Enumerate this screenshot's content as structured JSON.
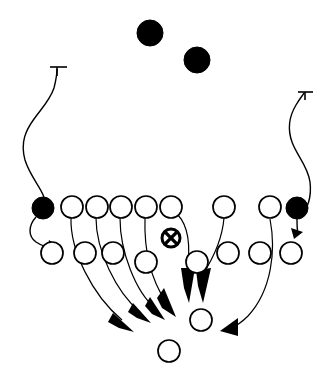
{
  "diagram": {
    "type": "american-football-play",
    "background_color": "#ffffff",
    "line_color": "#000000",
    "width": 332,
    "height": 384,
    "legend": {
      "filled_circle": "defensive-back",
      "open_circle": "offensive-player",
      "circle_with_x": "ball-carrier",
      "arrow": "movement-route",
      "t-bar": "block-or-stop-route"
    },
    "defenders_deep": [
      {
        "name": "deep-defender-left",
        "cx": 150,
        "cy": 33,
        "r": 13
      },
      {
        "name": "deep-defender-right",
        "cx": 197,
        "cy": 60,
        "r": 13
      }
    ],
    "defenders_edge": [
      {
        "name": "edge-defender-left",
        "cx": 43,
        "cy": 208,
        "r": 11
      },
      {
        "name": "edge-defender-right",
        "cx": 297,
        "cy": 208,
        "r": 11
      }
    ],
    "front_row": [
      {
        "name": "front-1",
        "cx": 72,
        "cy": 207,
        "r": 11
      },
      {
        "name": "front-2",
        "cx": 97,
        "cy": 207,
        "r": 11
      },
      {
        "name": "front-3",
        "cx": 121,
        "cy": 207,
        "r": 11
      },
      {
        "name": "front-4",
        "cx": 146,
        "cy": 207,
        "r": 11
      },
      {
        "name": "front-5",
        "cx": 171,
        "cy": 207,
        "r": 11
      },
      {
        "name": "front-6",
        "cx": 224,
        "cy": 207,
        "r": 11
      },
      {
        "name": "front-7",
        "cx": 270,
        "cy": 207,
        "r": 11
      }
    ],
    "second_row": [
      {
        "name": "second-1",
        "cx": 52,
        "cy": 253,
        "r": 11
      },
      {
        "name": "second-2",
        "cx": 85,
        "cy": 253,
        "r": 11
      },
      {
        "name": "second-3",
        "cx": 113,
        "cy": 253,
        "r": 11
      },
      {
        "name": "second-4",
        "cx": 146,
        "cy": 262,
        "r": 11
      },
      {
        "name": "second-5",
        "cx": 197,
        "cy": 262,
        "r": 11
      },
      {
        "name": "second-6",
        "cx": 228,
        "cy": 253,
        "r": 11
      },
      {
        "name": "second-7",
        "cx": 260,
        "cy": 253,
        "r": 11
      },
      {
        "name": "second-8",
        "cx": 291,
        "cy": 253,
        "r": 11
      }
    ],
    "ball_carrier": {
      "name": "ball-carrier",
      "cx": 171,
      "cy": 238,
      "r": 9
    },
    "back_row": [
      {
        "name": "back-1",
        "cx": 201,
        "cy": 320,
        "r": 11
      },
      {
        "name": "back-2",
        "cx": 169,
        "cy": 351,
        "r": 11
      }
    ],
    "routes": [
      {
        "name": "route-left-sweep",
        "from": "edge-defender-left",
        "to": "t-bar-left",
        "style": "curve-with-t-stop"
      },
      {
        "name": "route-right-sweep",
        "from": "edge-defender-right",
        "to": "t-bar-right",
        "style": "curve-with-t-stop"
      },
      {
        "name": "route-front-1-down",
        "from": "front-1",
        "to": "arrow-1",
        "style": "curve-with-arrow"
      },
      {
        "name": "route-front-2-down",
        "from": "front-2",
        "to": "arrow-2",
        "style": "curve-with-arrow"
      },
      {
        "name": "route-front-3-down",
        "from": "front-3",
        "to": "arrow-3",
        "style": "curve-with-arrow"
      },
      {
        "name": "route-front-4-down",
        "from": "front-4",
        "to": "arrow-4",
        "style": "curve-with-arrow"
      },
      {
        "name": "route-front-5-down",
        "from": "front-5",
        "to": "arrow-5",
        "style": "curve-with-arrow"
      },
      {
        "name": "route-front-6-down",
        "from": "front-6",
        "to": "arrow-6",
        "style": "curve-with-arrow"
      },
      {
        "name": "route-front-7-sweep",
        "from": "front-7",
        "to": "arrow-7",
        "style": "long-curve-with-arrow"
      }
    ],
    "arrow_tips": [
      {
        "name": "arrow-1",
        "x": 130,
        "y": 328
      },
      {
        "name": "arrow-2",
        "x": 148,
        "y": 320
      },
      {
        "name": "arrow-3",
        "x": 160,
        "y": 318
      },
      {
        "name": "arrow-4",
        "x": 178,
        "y": 315
      },
      {
        "name": "arrow-5",
        "x": 189,
        "y": 303
      },
      {
        "name": "arrow-6",
        "x": 202,
        "y": 303
      },
      {
        "name": "arrow-7",
        "x": 223,
        "y": 328
      }
    ]
  }
}
